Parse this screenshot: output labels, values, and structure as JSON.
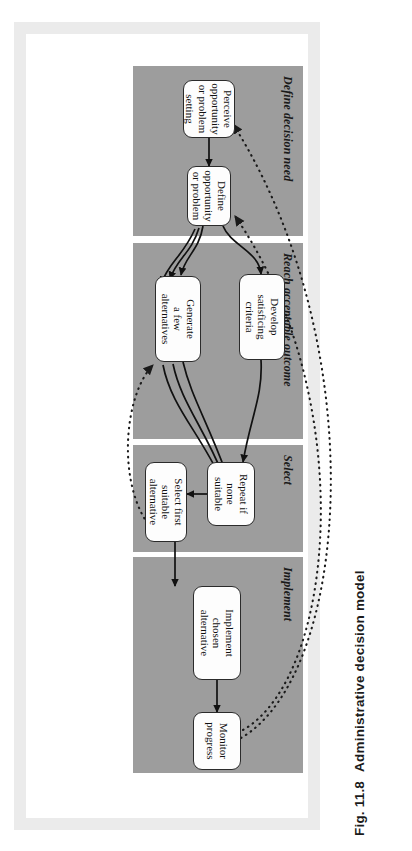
{
  "figure": {
    "caption_number": "Fig. 11.8",
    "caption_title": "Administrative decision model"
  },
  "colors": {
    "panel_gray": "#9d9d9d",
    "node_fill": "#fdfdfd",
    "node_border": "#2b2b2b",
    "frame_gray": "#ebebeb",
    "page_white": "#ffffff",
    "arrow_solid": "#111111",
    "arrow_dotted": "#1a1a1a"
  },
  "diagram": {
    "type": "process-flow",
    "orientation": "rotated-90-ccw",
    "stages": [
      {
        "id": "define-decision-need",
        "label": "Define decision need",
        "nodes": [
          {
            "id": "perceive",
            "lines": [
              "Perceive",
              "opportunity",
              "or problem",
              "setting"
            ]
          },
          {
            "id": "define",
            "lines": [
              "Define",
              "opportunity",
              "or problem"
            ]
          }
        ]
      },
      {
        "id": "reach-acceptable-outcome",
        "label": "Reach acceptable outcome",
        "nodes": [
          {
            "id": "develop-criteria",
            "lines": [
              "Develop",
              "satisficing",
              "criteria"
            ]
          },
          {
            "id": "generate-alternatives",
            "lines": [
              "Generate",
              "a few",
              "alternatives"
            ]
          }
        ]
      },
      {
        "id": "select",
        "label": "Select",
        "nodes": [
          {
            "id": "repeat-if-none",
            "lines": [
              "Repeat if",
              "none",
              "suitable"
            ]
          },
          {
            "id": "select-first",
            "lines": [
              "Select first",
              "suitable",
              "alternative"
            ]
          }
        ]
      },
      {
        "id": "implement",
        "label": "Implement",
        "nodes": [
          {
            "id": "implement-chosen",
            "lines": [
              "Implement",
              "chosen",
              "alternative"
            ]
          },
          {
            "id": "monitor-progress",
            "lines": [
              "Monitor",
              "progress"
            ]
          }
        ]
      }
    ],
    "edges": [
      {
        "from": "perceive",
        "to": "define",
        "style": "solid"
      },
      {
        "from": "define",
        "to": "develop-criteria",
        "style": "solid"
      },
      {
        "from": "define",
        "to": "generate-alternatives",
        "style": "solid"
      },
      {
        "from": "develop-criteria",
        "to": "repeat-if-none",
        "style": "solid"
      },
      {
        "from": "generate-alternatives",
        "to": "repeat-if-none",
        "style": "solid"
      },
      {
        "from": "generate-alternatives",
        "to": "select-first",
        "style": "solid"
      },
      {
        "from": "repeat-if-none",
        "to": "select-first",
        "style": "solid"
      },
      {
        "from": "select-first",
        "to": "implement-chosen",
        "style": "solid"
      },
      {
        "from": "implement-chosen",
        "to": "monitor-progress",
        "style": "solid"
      },
      {
        "from": "select-first",
        "to": "generate-alternatives",
        "style": "dotted"
      },
      {
        "from": "monitor-progress",
        "to": "define",
        "style": "dotted"
      },
      {
        "from": "monitor-progress",
        "to": "perceive",
        "style": "dotted"
      }
    ]
  }
}
